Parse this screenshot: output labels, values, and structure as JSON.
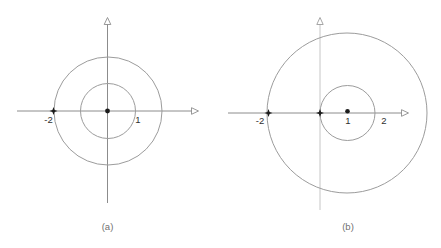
{
  "figures": [
    {
      "caption": "(a)",
      "labels": {
        "neg2": "-2",
        "one": "1"
      },
      "description": "two concentric circles centered at origin, radii 1 and 2, marked point at -2"
    },
    {
      "caption": "(b)",
      "labels": {
        "neg2": "-2",
        "one": "1",
        "two": "2"
      },
      "description": "small circle through 0 and 2 centered at 1, large circle centered near 1 through -2, marked points at origin, 1 and -2"
    }
  ],
  "colors": {
    "axis": "#8c8c8c",
    "axis_light": "#c6c6c6",
    "circle_stroke": "#9c9c9c",
    "marker": "#1c1c1c",
    "label_text": "#2f2f2f",
    "caption_text": "#707070",
    "background": "#ffffff"
  }
}
